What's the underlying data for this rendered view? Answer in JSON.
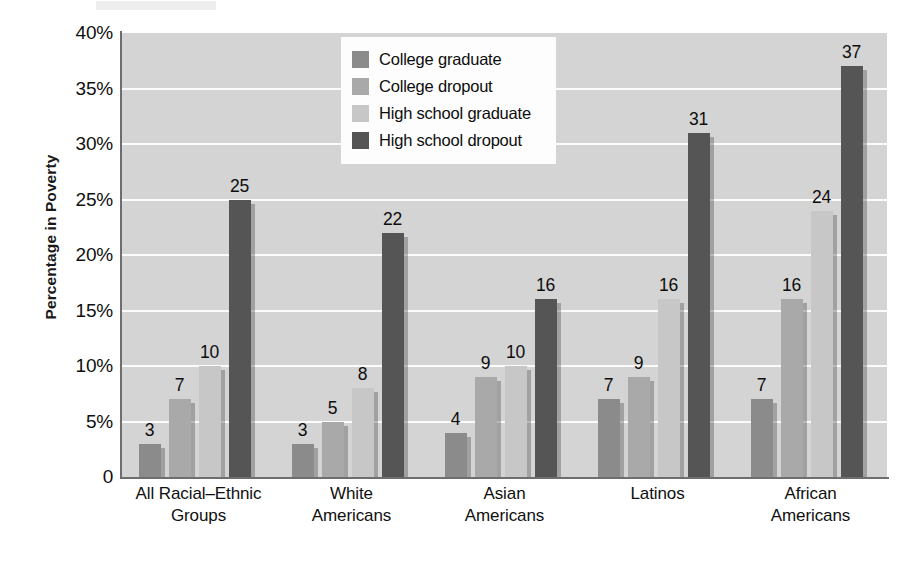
{
  "chart_data": {
    "type": "bar",
    "title": "",
    "subtitle": "",
    "xlabel": "",
    "ylabel": "Percentage in Poverty",
    "ylim": [
      0,
      40
    ],
    "y_tick_labels": [
      "0",
      "5%",
      "10%",
      "15%",
      "20%",
      "25%",
      "30%",
      "35%",
      "40%"
    ],
    "y_tick_values": [
      0,
      5,
      10,
      15,
      20,
      25,
      30,
      35,
      40
    ],
    "grid": "horizontal",
    "legend_position": "inside-top-center",
    "categories": [
      "All Racial–Ethnic Groups",
      "White Americans",
      "Asian Americans",
      "Latinos",
      "African Americans"
    ],
    "category_lines": [
      [
        "All Racial–Ethnic",
        "Groups"
      ],
      [
        "White",
        "Americans"
      ],
      [
        "Asian",
        "Americans"
      ],
      [
        "Latinos"
      ],
      [
        "African",
        "Americans"
      ]
    ],
    "series": [
      {
        "name": "College graduate",
        "color": "#8b8b8b",
        "values": [
          3,
          3,
          4,
          7,
          7
        ]
      },
      {
        "name": "College dropout",
        "color": "#a9a9a9",
        "values": [
          7,
          5,
          9,
          9,
          16
        ]
      },
      {
        "name": "High school graduate",
        "color": "#c7c7c7",
        "values": [
          10,
          8,
          10,
          16,
          24
        ]
      },
      {
        "name": "High school dropout",
        "color": "#555555",
        "values": [
          25,
          22,
          16,
          31,
          37
        ]
      }
    ],
    "data_labels": [
      [
        3,
        7,
        10,
        25
      ],
      [
        3,
        5,
        8,
        22
      ],
      [
        4,
        9,
        10,
        16
      ],
      [
        7,
        9,
        16,
        31
      ],
      [
        7,
        16,
        24,
        37
      ]
    ]
  },
  "colors": {
    "plot_background": "#d4d4d4",
    "gridline": "#fbfbfb",
    "axis_line": "#6e6e6e",
    "legend_background": "#fdfdfd",
    "text": "#101010",
    "page_background": "#ffffff"
  }
}
